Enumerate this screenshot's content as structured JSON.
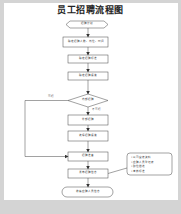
{
  "title": "员工招聘流程图",
  "nodes": {
    "start": "招聘计划",
    "step1": "确定招聘人数、岗位、时间",
    "step2": "确定招聘标准",
    "step3": "确定招聘渠道",
    "decision": "内部招聘",
    "step4": "外部招聘",
    "step5": "选择招聘渠道",
    "step6": "招聘准备",
    "step7": "发布招聘信息",
    "end": "收集应聘人员信息"
  },
  "edges": {
    "yes_label": "可行",
    "no_label": "不可行"
  },
  "callout": {
    "items": [
      "公司宣传资料",
      "应聘人员登记表",
      "职位描述",
      "考核标准"
    ],
    "bullet": "•"
  },
  "colors": {
    "background": "#d4d4d4",
    "page": "#ffffff",
    "stroke": "#333333"
  }
}
